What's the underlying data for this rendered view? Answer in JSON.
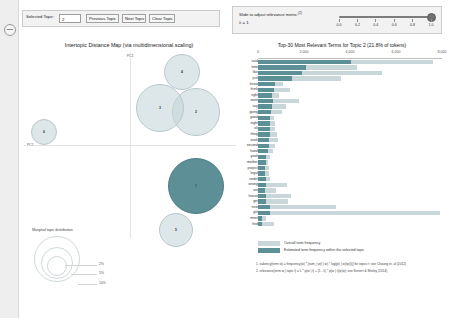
{
  "toolbar": {
    "selected_topic_label": "Selected Topic:",
    "selected_topic_value": "2",
    "previous_topic_label": "Previous Topic",
    "next_topic_label": "Next Topic",
    "clear_topic_label": "Clear Topic"
  },
  "slider": {
    "label": "Slide to adjust relevance metric:",
    "superscript": "(2)",
    "lambda_label": "λ = 1",
    "value": 1.0,
    "ticks": [
      "0.0",
      "0.2",
      "0.4",
      "0.6",
      "0.8",
      "1.0"
    ]
  },
  "mds": {
    "title": "Intertopic Distance Map (via multidimensional scaling)",
    "x_axis_label": "PC1",
    "y_axis_label": "PC2",
    "legend_title": "Marginal topic distribution",
    "legend_sizes": [
      "2%",
      "5%",
      "10%"
    ]
  },
  "chart_data": {
    "type": "bar",
    "orientation": "horizontal",
    "title": "Top-30 Most Relevant Terms for Topic 2 (21.8% of tokens)",
    "xlabel": "",
    "ylabel": "",
    "xlim": [
      0,
      8000
    ],
    "xticks": [
      0,
      2000,
      4000,
      6000,
      8000
    ],
    "xtick_labels": [
      "0",
      "2,000",
      "4,000",
      "6,000",
      "8,000"
    ],
    "grid": false,
    "legend_position": "bottom",
    "series": [
      {
        "name": "Overall term frequency",
        "color": "#c9d7da"
      },
      {
        "name": "Estimated term frequency within the selected topic",
        "color": "#5d8f96"
      }
    ],
    "categories": [
      "said",
      "time",
      "like",
      "just",
      "know",
      "think",
      "right",
      "want",
      "say",
      "going",
      "good",
      "night",
      "ok",
      "thing",
      "work",
      "second",
      "hand",
      "yeah",
      "mother",
      "project",
      "legal",
      "under",
      "wrong",
      "out",
      "house",
      "get",
      "new",
      "girl",
      "meet",
      "find"
    ],
    "overall": [
      7600,
      4300,
      5400,
      3600,
      1100,
      1400,
      900,
      1800,
      1200,
      1050,
      700,
      760,
      720,
      820,
      880,
      760,
      640,
      500,
      430,
      470,
      460,
      520,
      1250,
      780,
      1450,
      1300,
      3400,
      7900,
      340,
      700
    ],
    "topic": [
      4050,
      2100,
      1900,
      1480,
      760,
      700,
      620,
      640,
      600,
      580,
      540,
      520,
      500,
      500,
      480,
      470,
      420,
      360,
      330,
      320,
      320,
      330,
      330,
      320,
      360,
      340,
      520,
      540,
      180,
      170
    ]
  },
  "topics": [
    {
      "id": 1,
      "x": 196,
      "y": 186,
      "r": 28,
      "selected": true
    },
    {
      "id": 2,
      "x": 196,
      "y": 112,
      "r": 24,
      "selected": false
    },
    {
      "id": 3,
      "x": 160,
      "y": 108,
      "r": 24,
      "selected": false
    },
    {
      "id": 4,
      "x": 182,
      "y": 72,
      "r": 18,
      "selected": false
    },
    {
      "id": 5,
      "x": 176,
      "y": 230,
      "r": 17,
      "selected": false
    },
    {
      "id": 6,
      "x": 44,
      "y": 132,
      "r": 13,
      "selected": false
    }
  ],
  "footnotes": {
    "note1": "1. saliency(term w) = frequency(w) * [sum_t p(t | w) * log(p(t | w)/p(t))] for topics t; see Chuang et. al (2012)",
    "note2": "2. relevance(term w | topic t) = λ * p(w | t) + (1 - λ) * p(w | t)/p(w); see Sievert & Shirley (2014)"
  }
}
